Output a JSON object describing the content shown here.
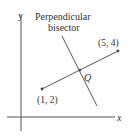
{
  "diagram": {
    "title_line1": "Perpendicular",
    "title_line2": "bisector",
    "axis_x_label": "x",
    "axis_y_label": "y",
    "point_a_label": "(1, 2)",
    "point_b_label": "(5, 4)",
    "midpoint_label": "Q",
    "colors": {
      "line": "#555555",
      "text": "#333333",
      "background": "#ffffff"
    }
  }
}
